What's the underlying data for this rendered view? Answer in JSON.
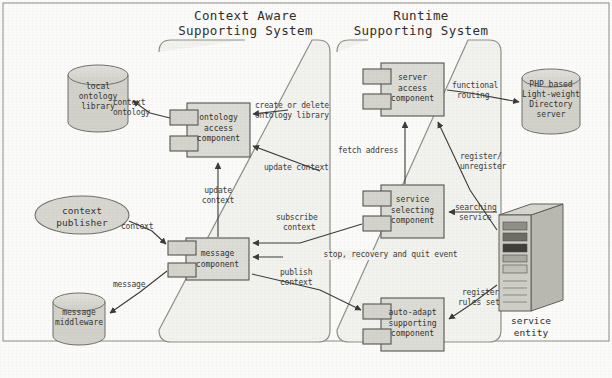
{
  "figure": {
    "caption": "",
    "background": "#fbfbfa",
    "ink": "#3a3a38",
    "fill_component": "#dcdcd6",
    "fill_store": "#d2d2cb"
  },
  "panels": [
    {
      "id": "context-aware",
      "title_line1": "Context Aware",
      "title_line2": "Supporting System"
    },
    {
      "id": "runtime",
      "title_line1": "Runtime",
      "title_line2": "Supporting System"
    }
  ],
  "components": [
    {
      "id": "ontology-access-component",
      "line1": "ontology",
      "line2": "access",
      "line3": "component"
    },
    {
      "id": "message-component",
      "line1": "message",
      "line2": "component",
      "line3": ""
    },
    {
      "id": "server-access-component",
      "line1": "server",
      "line2": "access",
      "line3": "component"
    },
    {
      "id": "service-selecting-component",
      "line1": "service",
      "line2": "selecting",
      "line3": "component"
    },
    {
      "id": "auto-adapt-supporting-component",
      "line1": "auto-adapt",
      "line2": "supporting",
      "line3": "component"
    }
  ],
  "stores": [
    {
      "id": "local-ontology-library",
      "line1": "local",
      "line2": "ontology",
      "line3": "library",
      "line4": ""
    },
    {
      "id": "message-middleware",
      "line1": "message",
      "line2": "middleware",
      "line3": "",
      "line4": ""
    },
    {
      "id": "ldap-directory-server",
      "line1": "PHP based",
      "line2": "Light-weight",
      "line3": "Directory",
      "line4": "server"
    }
  ],
  "actors": [
    {
      "id": "context-publisher",
      "line1": "context",
      "line2": "publisher"
    },
    {
      "id": "service-entity",
      "line1": "service",
      "line2": "entity"
    }
  ],
  "edges": [
    {
      "id": "context-ontology",
      "line1": "context",
      "line2": "ontology"
    },
    {
      "id": "create-or-delete-ontology-library",
      "line1": "create or delete",
      "line2": "ontology library"
    },
    {
      "id": "update-context-right",
      "line1": "update context",
      "line2": ""
    },
    {
      "id": "update-context-vertical",
      "line1": "update",
      "line2": "context"
    },
    {
      "id": "context",
      "line1": "context",
      "line2": ""
    },
    {
      "id": "message",
      "line1": "message",
      "line2": ""
    },
    {
      "id": "subscribe-context",
      "line1": "subscribe",
      "line2": "context"
    },
    {
      "id": "publish-context",
      "line1": "publish",
      "line2": "context"
    },
    {
      "id": "stop-recovery-and-quit-event",
      "line1": "stop, recovery and quit event",
      "line2": ""
    },
    {
      "id": "fetch-address",
      "line1": "fetch address",
      "line2": ""
    },
    {
      "id": "functional-routing",
      "line1": "functional",
      "line2": "routing"
    },
    {
      "id": "register-unregister",
      "line1": "register/",
      "line2": "unregister"
    },
    {
      "id": "searching-service",
      "line1": "searching",
      "line2": "service"
    },
    {
      "id": "register-rules-set",
      "line1": "register",
      "line2": "rules set"
    }
  ]
}
